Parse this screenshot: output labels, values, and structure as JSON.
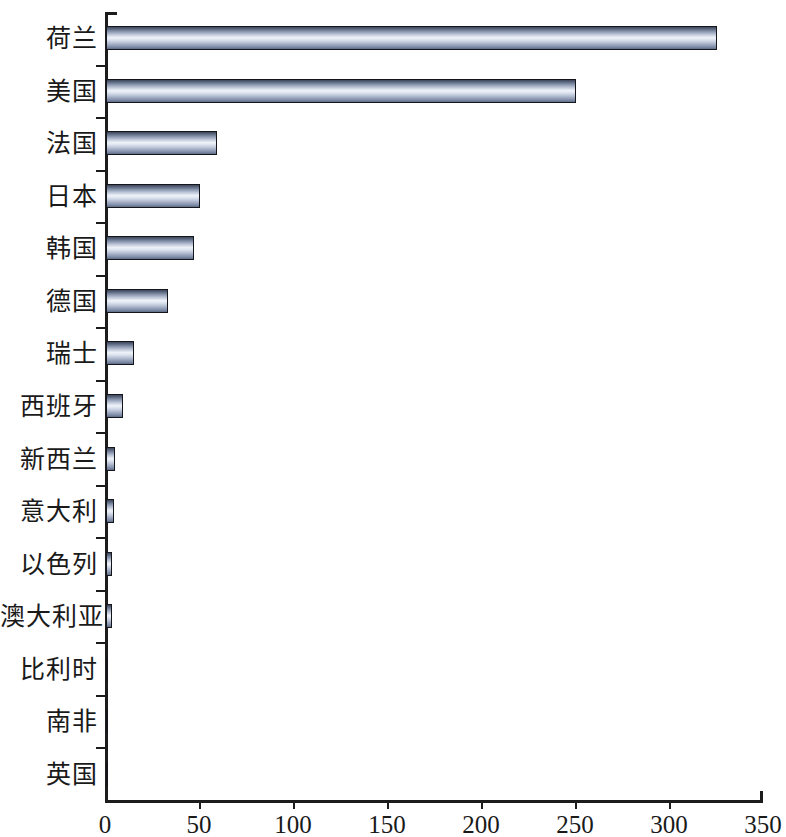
{
  "chart_data": {
    "type": "bar",
    "orientation": "horizontal",
    "title": "",
    "subtitle": "",
    "xlabel": "",
    "ylabel": "",
    "xlim": [
      0,
      350
    ],
    "ylim": null,
    "grid": false,
    "legend": null,
    "x_ticks": [
      0,
      50,
      100,
      150,
      200,
      250,
      300,
      350
    ],
    "x_tick_labels": [
      "0",
      "50",
      "100",
      "150",
      "200",
      "250",
      "300",
      "350"
    ],
    "categories": [
      "荷兰",
      "美国",
      "法国",
      "日本",
      "韩国",
      "德国",
      "瑞士",
      "西班牙",
      "新西兰",
      "意大利",
      "以色列",
      "澳大利亚",
      "比利时",
      "南非",
      "英国"
    ],
    "values": [
      325,
      250,
      59,
      50,
      47,
      33,
      15,
      9,
      5,
      4,
      3,
      3,
      1,
      0.5,
      0.5
    ],
    "bar_fill_top_color": "#3d4659",
    "bar_fill_mid_color": "#eef2f8",
    "bar_fill_bottom_color": "#5e6b85",
    "bar_edge_color": "#14161c",
    "axis_color": "#1c1c1c",
    "background_color": "#ffffff"
  }
}
